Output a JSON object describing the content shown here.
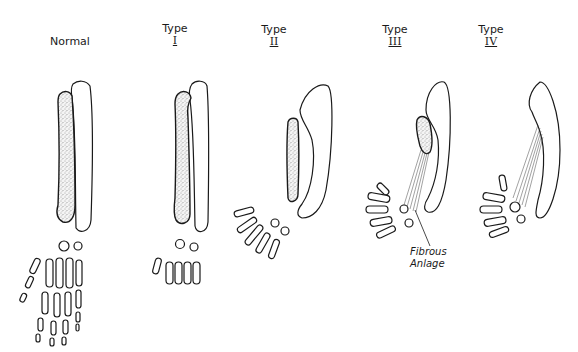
{
  "figure": {
    "columns": [
      {
        "id": "normal",
        "heading": "Normal",
        "type_word": "",
        "roman": "",
        "radius": "full-length, stippled",
        "ulna": "straight"
      },
      {
        "id": "type-1",
        "heading": "",
        "type_word": "Type",
        "roman": "I",
        "radius": "short distal radius",
        "ulna": "straight"
      },
      {
        "id": "type-2",
        "heading": "",
        "type_word": "Type",
        "roman": "II",
        "radius": "hypoplastic, short",
        "ulna": "bowed"
      },
      {
        "id": "type-3",
        "heading": "",
        "type_word": "Type",
        "roman": "III",
        "radius": "proximal remnant with fibrous anlage",
        "ulna": "bowed"
      },
      {
        "id": "type-4",
        "heading": "",
        "type_word": "Type",
        "roman": "IV",
        "radius": "absent, fibrous anlage only",
        "ulna": "bowed"
      }
    ],
    "annotations": [
      {
        "id": "fibrous-anlage",
        "line1": "Fibrous",
        "line2": "Anlage"
      }
    ]
  },
  "colors": {
    "ink": "#1a1a1a",
    "background": "#ffffff",
    "stipple": "#555555"
  }
}
